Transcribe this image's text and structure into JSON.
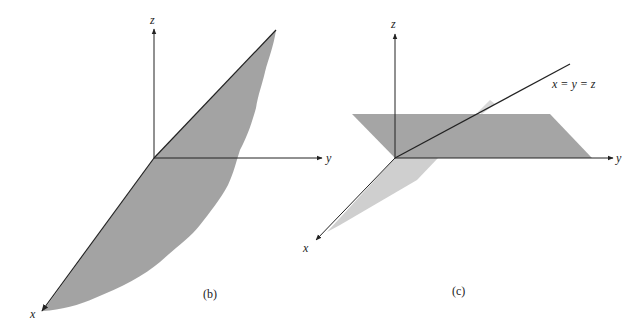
{
  "figures": [
    {
      "id": "b",
      "caption": "(b)",
      "axes": {
        "x": "x",
        "y": "y",
        "z": "z"
      },
      "description": "Plane containing the x-axis, tilted upward toward the y-z direction"
    },
    {
      "id": "c",
      "caption": "(c)",
      "axes": {
        "x": "x",
        "y": "y",
        "z": "z"
      },
      "line_label": "x = y = z",
      "description": "Line x = y = z with horizontal plane and a vertical plane through x-axis"
    }
  ],
  "colors": {
    "plane_dark": "#9a9a9a",
    "plane_light": "#c8c8c8",
    "axis": "#222222",
    "background": "#ffffff"
  }
}
